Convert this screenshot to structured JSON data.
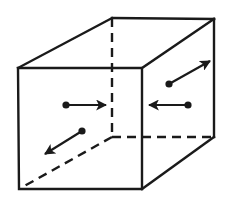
{
  "diagram": {
    "title": "",
    "colors": {
      "line": "#1a1a1a",
      "background": "#ffffff"
    },
    "cube": {
      "front_face": {
        "tl": [
          18,
          68
        ],
        "tr": [
          142,
          68
        ],
        "br": [
          142,
          189
        ],
        "bl": [
          19,
          189
        ]
      },
      "back_face": {
        "tl": [
          112,
          18
        ],
        "tr": [
          214,
          19
        ],
        "br": [
          214,
          137
        ],
        "bl": [
          112,
          137
        ]
      },
      "hidden_edges": [
        "back-left-vertical",
        "back-bottom-horizontal",
        "bottom-left-depth"
      ]
    },
    "arrows": [
      {
        "name": "arrow-right-front",
        "from": [
          66,
          105
        ],
        "to": [
          106,
          105
        ]
      },
      {
        "name": "arrow-left-right-face",
        "from": [
          188,
          105
        ],
        "to": [
          149,
          105
        ]
      },
      {
        "name": "arrow-up-right-diagonal",
        "from": [
          169,
          84
        ],
        "to": [
          210,
          61
        ]
      },
      {
        "name": "arrow-down-left-diagonal",
        "from": [
          82,
          131
        ],
        "to": [
          45,
          154
        ]
      }
    ]
  }
}
